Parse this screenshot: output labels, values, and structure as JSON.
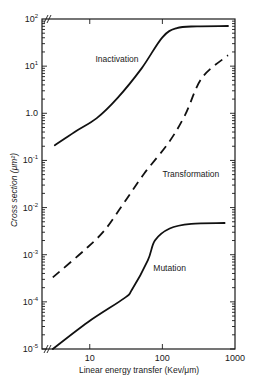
{
  "chart_data": {
    "type": "line",
    "title": "",
    "xlabel": "Linear energy transfer (Kev/μm)",
    "ylabel": "Cross section (μm²)",
    "xscale": "log",
    "yscale": "log",
    "xlim": [
      2.2,
      1000
    ],
    "ylim": [
      1e-05,
      100
    ],
    "grid": false,
    "legend": "inline curve labels",
    "x_ticks": [
      {
        "value": 10,
        "label": "10"
      },
      {
        "value": 100,
        "label": "100"
      },
      {
        "value": 1000,
        "label": "1000"
      }
    ],
    "y_ticks": [
      {
        "value": 100,
        "base": "10",
        "exp": "2"
      },
      {
        "value": 10,
        "base": "10",
        "exp": "1"
      },
      {
        "value": 1,
        "base": "1.0",
        "exp": ""
      },
      {
        "value": 0.1,
        "base": "10",
        "exp": "-1"
      },
      {
        "value": 0.01,
        "base": "10",
        "exp": "-2"
      },
      {
        "value": 0.001,
        "base": "10",
        "exp": "-3"
      },
      {
        "value": 0.0001,
        "base": "10",
        "exp": "-4"
      },
      {
        "value": 1e-05,
        "base": "10",
        "exp": "-5"
      }
    ],
    "series": [
      {
        "name": "Inactivation",
        "style": "solid",
        "label_at": {
          "x": 12,
          "y": 12
        },
        "x": [
          3.3,
          6.5,
          12.5,
          24,
          52,
          100,
          158,
          300,
          800
        ],
        "y": [
          0.21,
          0.42,
          0.79,
          2.1,
          9.1,
          41,
          64,
          70,
          71
        ]
      },
      {
        "name": "Transformation",
        "style": "dashed",
        "label_at": {
          "x": 100,
          "y": 0.045
        },
        "x": [
          3.1,
          8.5,
          16,
          30,
          57,
          120,
          205,
          350,
          800
        ],
        "y": [
          0.00033,
          0.00126,
          0.0033,
          0.013,
          0.054,
          0.23,
          0.91,
          5.6,
          17
        ]
      },
      {
        "name": "Mutation",
        "style": "solid",
        "label_at": {
          "x": 75,
          "y": 0.00045
        },
        "x": [
          3.1,
          9.4,
          30,
          38,
          63,
          79,
          126,
          250,
          720
        ],
        "y": [
          1e-05,
          3.7e-05,
          0.00012,
          0.00018,
          0.00076,
          0.002,
          0.0036,
          0.0045,
          0.0047
        ]
      }
    ]
  }
}
